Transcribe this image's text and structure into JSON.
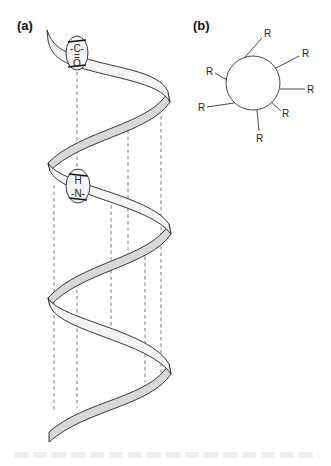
{
  "figure": {
    "panel_a": {
      "label": "(a)",
      "carbonyl": {
        "top": "-C-",
        "bond": "=",
        "bottom": "O"
      },
      "amide": {
        "top": "H",
        "bond": "|",
        "bottom": "-N-"
      },
      "description": "alpha helix ribbon with dashed hydrogen-bond lines"
    },
    "panel_b": {
      "label": "(b)",
      "residue_label": "R",
      "residue_count": 8,
      "description": "end-on view of helix with side chains R projecting outward"
    }
  }
}
